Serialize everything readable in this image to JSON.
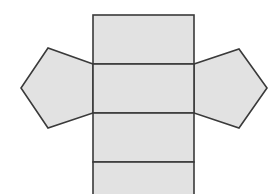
{
  "diagram": {
    "type": "pentagonal-prism-net",
    "colors": {
      "fill": "#e2e2e2",
      "stroke": "#3a3a3a",
      "background": "#ffffff"
    },
    "stroke_width": 1.6,
    "faces": {
      "rect_top": {
        "x": 93,
        "y": 15,
        "w": 101,
        "h": 49
      },
      "rect_middle": {
        "x": 93,
        "y": 64,
        "w": 101,
        "h": 49
      },
      "rect_lower": {
        "x": 93,
        "y": 113,
        "w": 101,
        "h": 49
      },
      "rect_bottom": {
        "x": 93,
        "y": 162,
        "w": 101,
        "h": 40
      },
      "pentagon_left": "93,64 48,48 21,88 48,128 93,113",
      "pentagon_right": "194,64 239,49 267,88 239,128 194,113"
    }
  }
}
